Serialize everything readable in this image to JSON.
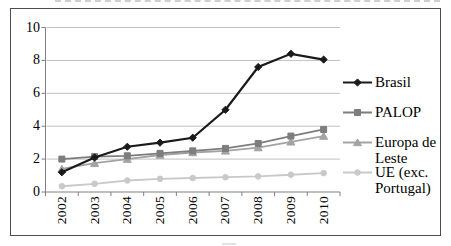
{
  "chart_data": {
    "type": "line",
    "title": "",
    "xlabel": "",
    "ylabel": "",
    "categories": [
      "2002",
      "2003",
      "2004",
      "2005",
      "2006",
      "2007",
      "2008",
      "2009",
      "2010"
    ],
    "ylim": [
      0,
      10
    ],
    "yticks": [
      0,
      2,
      4,
      6,
      8,
      10
    ],
    "grid": true,
    "legend_position": "right",
    "series": [
      {
        "name": "Brasil",
        "marker": "diamond",
        "color": "#1a1a1a",
        "values": [
          1.2,
          2.1,
          2.75,
          3.0,
          3.3,
          5.0,
          7.6,
          8.4,
          8.05
        ]
      },
      {
        "name": "PALOP",
        "marker": "square",
        "color": "#7d7d7d",
        "values": [
          2.0,
          2.15,
          2.2,
          2.35,
          2.5,
          2.65,
          2.95,
          3.4,
          3.8
        ]
      },
      {
        "name": "Europa de Leste",
        "marker": "triangle",
        "color": "#a3a3a3",
        "values": [
          1.4,
          1.75,
          2.0,
          2.25,
          2.4,
          2.5,
          2.7,
          3.05,
          3.4
        ]
      },
      {
        "name": "UE (exc. Portugal)",
        "marker": "circle",
        "color": "#c9c9c9",
        "values": [
          0.35,
          0.5,
          0.7,
          0.8,
          0.85,
          0.9,
          0.95,
          1.05,
          1.15
        ]
      }
    ]
  },
  "colors": {
    "background": "#ffffff",
    "frame_border": "#4d4d4d",
    "gridline": "#c0c0c0",
    "axis": "#808080",
    "text": "#000000"
  }
}
